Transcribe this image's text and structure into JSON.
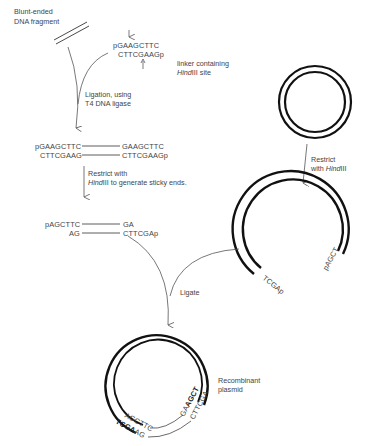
{
  "diagram": {
    "type": "cloning workflow (linker addition and HindIII ligation into plasmid)",
    "blunt_fragment": {
      "label_line1": "Blunt-ended",
      "label_line2": "DNA fragment"
    },
    "linker": {
      "top_strand": "pGAAGCTTC",
      "bottom_strand": "CTTCGAAGp",
      "label_line1": "linker containing",
      "label_italic": "Hind",
      "label_rest": "III site"
    },
    "step_ligation": {
      "label_line1": "Ligation, using",
      "label_line2": "T4 DNA ligase"
    },
    "ligated_product": {
      "left_top": "pGAAGCTTC",
      "left_bottom": "CTTCGAAG",
      "right_top": "GAAGCTTC",
      "right_bottom": "CTTCGAAGp"
    },
    "step_restrict_fragment": {
      "label_line1": "Restrict with",
      "label_italic": "Hind",
      "label_rest": "III to generate sticky ends."
    },
    "sticky_fragment": {
      "left_top": "pAGCTTC",
      "left_bottom": "AG",
      "right_top": "GA",
      "right_bottom": "CTTCGAp"
    },
    "plasmid": {
      "step_restrict_line1": "Restrict",
      "step_restrict_prefix": "with ",
      "step_restrict_italic": "Hind",
      "step_restrict_rest": "III",
      "open_end_left": "TCGAp",
      "open_end_right": "pAGCT"
    },
    "step_ligate": {
      "label": "Ligate"
    },
    "recombinant": {
      "label_line1": "Recombinant",
      "label_line2": "plasmid",
      "left_outer": "AGCTTC",
      "left_inner_bold": "TCGA",
      "left_inner_rest": "AG",
      "right_outer_prefix": "GA",
      "right_outer_bold": "AGCT",
      "right_inner": "CTTCGA"
    }
  }
}
